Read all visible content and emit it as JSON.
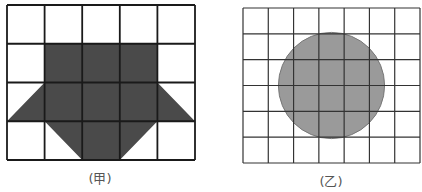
{
  "figures": [
    {
      "label": "(甲)",
      "grid": {
        "cols": 5,
        "rows": 4,
        "x0": 7,
        "y0": 5,
        "x1": 195,
        "y1": 160,
        "line_color": "#1a1a1a",
        "line_width": 1.8
      },
      "shape": {
        "type": "polygon",
        "fill": "#4a4a4a",
        "points_cells": [
          [
            1,
            1
          ],
          [
            4,
            1
          ],
          [
            4,
            2
          ],
          [
            5,
            3
          ],
          [
            4,
            3
          ],
          [
            3,
            4
          ],
          [
            2,
            4
          ],
          [
            1,
            3
          ],
          [
            0,
            3
          ],
          [
            1,
            2
          ]
        ]
      },
      "label_pos": {
        "x": 100,
        "y": 168
      }
    },
    {
      "label": "(乙)",
      "grid": {
        "cols": 7,
        "rows": 6,
        "x0": 243,
        "y0": 8,
        "x1": 420,
        "y1": 163,
        "line_color": "#333333",
        "line_width": 1.2
      },
      "shape": {
        "type": "circle",
        "fill": "#9a9a9a",
        "stroke": "#777777",
        "center_cells": [
          3.5,
          3
        ],
        "radius_cells": 2.1
      },
      "label_pos": {
        "x": 331,
        "y": 171
      }
    }
  ]
}
